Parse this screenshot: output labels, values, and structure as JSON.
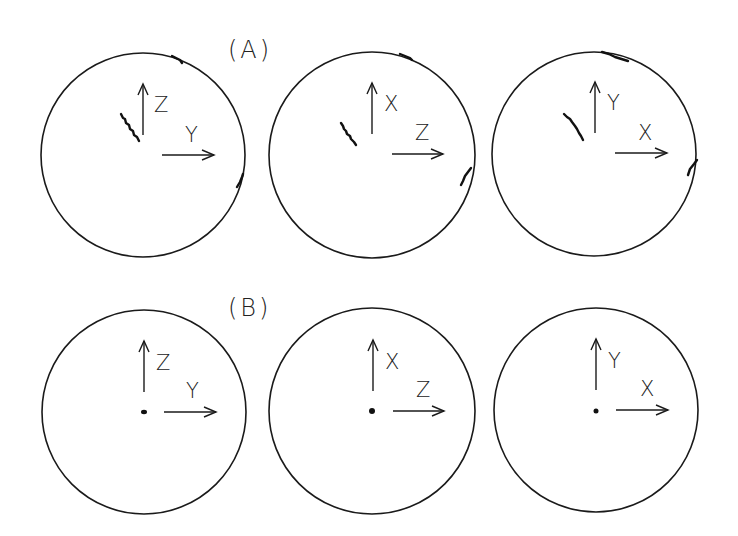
{
  "figure": {
    "panels": [
      {
        "label": "(A)",
        "plots": [
          {
            "vertical_axis": "Z",
            "horizontal_axis": "Y",
            "marker": "trace"
          },
          {
            "vertical_axis": "X",
            "horizontal_axis": "Z",
            "marker": "trace"
          },
          {
            "vertical_axis": "Y",
            "horizontal_axis": "X",
            "marker": "trace"
          }
        ]
      },
      {
        "label": "(B)",
        "plots": [
          {
            "vertical_axis": "Z",
            "horizontal_axis": "Y",
            "marker": "dot"
          },
          {
            "vertical_axis": "X",
            "horizontal_axis": "Z",
            "marker": "dot"
          },
          {
            "vertical_axis": "Y",
            "horizontal_axis": "X",
            "marker": "dot"
          }
        ]
      }
    ]
  }
}
